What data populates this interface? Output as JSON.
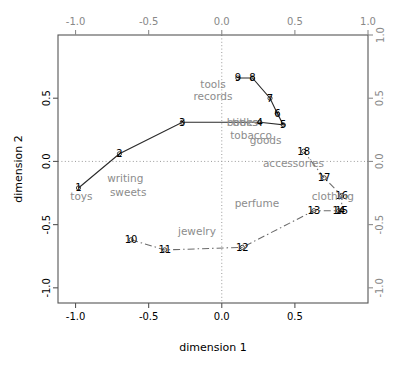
{
  "chart_data": {
    "type": "scatter",
    "title": "",
    "xlabel": "dimension 1",
    "ylabel": "dimension 2",
    "xlim": [
      -1.12,
      1.0
    ],
    "ylim": [
      -1.12,
      1.0
    ],
    "grid": false,
    "legend": "none",
    "axes": {
      "bottom_ticks": [
        "-1.0",
        "-0.5",
        "0.0",
        "0.5"
      ],
      "bottom_tick_values": [
        -1.0,
        -0.5,
        0.0,
        0.5
      ],
      "left_ticks": [
        "0.5",
        "0.0",
        "-0.5",
        "-1.0"
      ],
      "left_tick_values": [
        0.5,
        0.0,
        -0.5,
        -1.0
      ],
      "top_ticks": [
        "-1.0",
        "-0.5",
        "0.0",
        "0.5",
        "1.0"
      ],
      "top_tick_values": [
        -1.0,
        -0.5,
        0.0,
        0.5,
        1.0
      ],
      "right_ticks": [
        "1.0",
        "0.5",
        "0.0",
        "-0.5",
        "-1.0"
      ],
      "right_tick_values": [
        1.0,
        0.5,
        0.0,
        -0.5,
        -1.0
      ],
      "reference_lines": {
        "x": 0.0,
        "y": 0.0
      }
    },
    "series": [
      {
        "name": "trajectory-a",
        "linestyle": "solid",
        "color": "#2a2a2a",
        "points": [
          {
            "label": "1",
            "x": -0.98,
            "y": -0.21
          },
          {
            "label": "2",
            "x": -0.7,
            "y": 0.06
          },
          {
            "label": "3",
            "x": -0.27,
            "y": 0.31
          },
          {
            "label": "4",
            "x": 0.26,
            "y": 0.31
          },
          {
            "label": "5",
            "x": 0.42,
            "y": 0.29
          },
          {
            "label": "6",
            "x": 0.38,
            "y": 0.38
          },
          {
            "label": "7",
            "x": 0.33,
            "y": 0.5
          },
          {
            "label": "8",
            "x": 0.21,
            "y": 0.66
          },
          {
            "label": "9",
            "x": 0.11,
            "y": 0.66
          }
        ]
      },
      {
        "name": "trajectory-b",
        "linestyle": "dashdot",
        "color": "#6b6b6b",
        "points": [
          {
            "label": "10",
            "x": -0.62,
            "y": -0.62
          },
          {
            "label": "11",
            "x": -0.39,
            "y": -0.7
          },
          {
            "label": "12",
            "x": 0.14,
            "y": -0.68
          },
          {
            "label": "13",
            "x": 0.63,
            "y": -0.39
          },
          {
            "label": "14",
            "x": 0.8,
            "y": -0.39
          },
          {
            "label": "15",
            "x": 0.82,
            "y": -0.39
          },
          {
            "label": "16",
            "x": 0.82,
            "y": -0.27
          },
          {
            "label": "17",
            "x": 0.7,
            "y": -0.13
          },
          {
            "label": "18",
            "x": 0.56,
            "y": 0.08
          }
        ]
      }
    ],
    "category_labels": [
      {
        "text": "tools",
        "x": -0.06,
        "y": 0.61
      },
      {
        "text": "records",
        "x": -0.06,
        "y": 0.52
      },
      {
        "text": "books",
        "x": 0.14,
        "y": 0.31
      },
      {
        "text": "titles",
        "x": 0.16,
        "y": 0.31
      },
      {
        "text": "tobacco",
        "x": 0.2,
        "y": 0.21
      },
      {
        "text": "goods",
        "x": 0.3,
        "y": 0.17
      },
      {
        "text": "accessories",
        "x": 0.49,
        "y": -0.01
      },
      {
        "text": "clothing",
        "x": 0.76,
        "y": -0.27
      },
      {
        "text": "perfume",
        "x": 0.24,
        "y": -0.33
      },
      {
        "text": "jewelry",
        "x": -0.17,
        "y": -0.55
      },
      {
        "text": "toys",
        "x": -0.96,
        "y": -0.27
      },
      {
        "text": "writing",
        "x": -0.66,
        "y": -0.13
      },
      {
        "text": "sweets",
        "x": -0.64,
        "y": -0.24
      }
    ]
  }
}
